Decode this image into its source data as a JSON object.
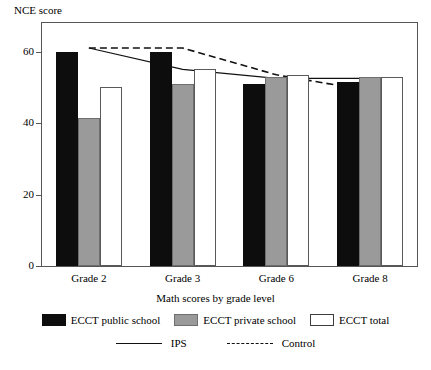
{
  "chart_data": {
    "type": "bar",
    "title": "",
    "ylabel": "NCE score",
    "xlabel": "Math scores by grade level",
    "categories": [
      "Grade 2",
      "Grade 3",
      "Grade 6",
      "Grade 8"
    ],
    "ylim": [
      0,
      68
    ],
    "yticks": [
      0,
      20,
      40,
      60
    ],
    "ytick_labels": [
      "0",
      "20",
      "40",
      "60"
    ],
    "grid": false,
    "legend_position": "bottom",
    "series": [
      {
        "name": "ECCT public school",
        "type": "bar",
        "color": "#0d0d0d",
        "values": [
          60,
          60,
          51,
          51.5
        ]
      },
      {
        "name": "ECCT private school",
        "type": "bar",
        "color": "#9a9a9a",
        "values": [
          41.5,
          51,
          53,
          53
        ]
      },
      {
        "name": "ECCT total",
        "type": "bar",
        "color": "#ffffff",
        "values": [
          50,
          55,
          53.5,
          53
        ]
      },
      {
        "name": "IPS",
        "type": "line",
        "style": "solid",
        "color": "#111111",
        "values": [
          61,
          55,
          52.5,
          52.5
        ]
      },
      {
        "name": "Control",
        "type": "line",
        "style": "dashed",
        "color": "#111111",
        "values": [
          61,
          61,
          53.5,
          49
        ]
      }
    ]
  },
  "legend": {
    "bars": [
      {
        "label": "ECCT public school",
        "swatch": "black"
      },
      {
        "label": "ECCT private school",
        "swatch": "gray"
      },
      {
        "label": "ECCT total",
        "swatch": "white"
      }
    ],
    "lines": [
      {
        "label": "IPS",
        "style": "solid"
      },
      {
        "label": "Control",
        "style": "dashed"
      }
    ]
  }
}
